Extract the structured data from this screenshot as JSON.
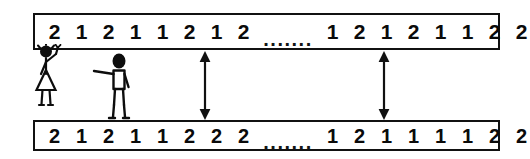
{
  "diagram": {
    "background_color": "#ffffff",
    "ink_color": "#000000",
    "ellipsis_text": ".......",
    "sequences": [
      {
        "name": "top-sequence",
        "left_values": [
          "2",
          "1",
          "2",
          "1",
          "1",
          "2",
          "1",
          "2"
        ],
        "right_values": [
          "1",
          "2",
          "1",
          "2",
          "1",
          "1",
          "2",
          "2"
        ]
      },
      {
        "name": "bottom-sequence",
        "left_values": [
          "2",
          "1",
          "2",
          "1",
          "1",
          "2",
          "2",
          "2"
        ],
        "right_values": [
          "1",
          "2",
          "1",
          "1",
          "1",
          "1",
          "2",
          "2"
        ]
      }
    ],
    "markers": [
      {
        "name": "difference-marker-1",
        "type": "double-headed-vertical-arrow",
        "x": 194,
        "y": 51
      },
      {
        "name": "difference-marker-2",
        "type": "double-headed-vertical-arrow",
        "x": 373,
        "y": 51
      }
    ],
    "figures": [
      {
        "name": "person-with-skirt",
        "pose": "raised-arm-waving"
      },
      {
        "name": "person-with-trousers",
        "pose": "arm-pointing-left"
      }
    ]
  }
}
